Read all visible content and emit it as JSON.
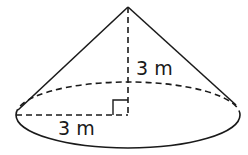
{
  "diagram": {
    "type": "cone",
    "height_label": "3 m",
    "radius_label": "3 m",
    "right_angle_marker": true,
    "colors": {
      "stroke": "#1a1a1a",
      "background": "#ffffff"
    }
  }
}
